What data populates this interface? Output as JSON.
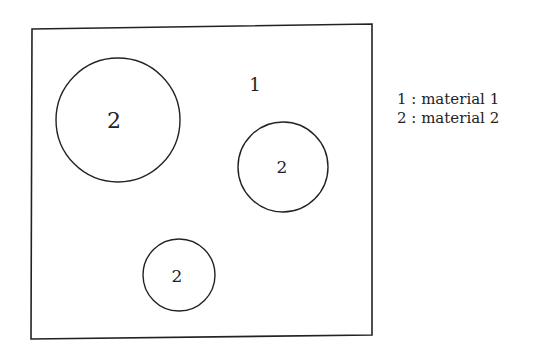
{
  "diagram": {
    "region_label": "1",
    "inclusions": [
      {
        "label": "2",
        "cx": 118,
        "cy": 120,
        "r": 62
      },
      {
        "label": "2",
        "cx": 283,
        "cy": 167,
        "r": 45
      },
      {
        "label": "2",
        "cx": 179,
        "cy": 275,
        "r": 36
      }
    ]
  },
  "legend": {
    "items": [
      {
        "key": "1",
        "text": "1 : material 1"
      },
      {
        "key": "2",
        "text": "2 : material 2"
      }
    ]
  }
}
